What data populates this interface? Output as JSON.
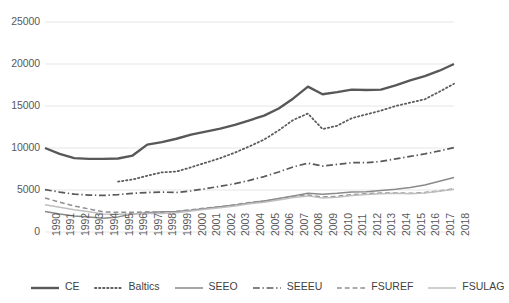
{
  "chart_data": {
    "type": "line",
    "title": "",
    "subtitle": "",
    "xlabel": "",
    "ylabel": "",
    "grid": true,
    "legend_position": "bottom",
    "ylim": [
      0,
      25000
    ],
    "yticks": [
      "0",
      "5000",
      "10000",
      "15000",
      "20000",
      "25000"
    ],
    "ytick_values": [
      0,
      5000,
      10000,
      15000,
      20000,
      25000
    ],
    "x": [
      "1990",
      "1991",
      "1992",
      "1993",
      "1994",
      "1995",
      "1996",
      "1997",
      "1998",
      "1999",
      "2000",
      "2001",
      "2002",
      "2003",
      "2004",
      "2005",
      "2006",
      "2007",
      "2008",
      "2009",
      "2010",
      "2011",
      "2012",
      "2013",
      "2014",
      "2015",
      "2016",
      "2017",
      "2018"
    ],
    "series": [
      {
        "name": "CE",
        "style": "solid",
        "width": 2.4,
        "color": "#58585a",
        "values": [
          10000,
          9300,
          8800,
          8700,
          8700,
          8750,
          9100,
          10400,
          10700,
          11100,
          11600,
          11950,
          12300,
          12750,
          13300,
          13850,
          14700,
          15900,
          17300,
          16400,
          16650,
          16950,
          16900,
          16950,
          17450,
          18050,
          18550,
          19200,
          20000
        ]
      },
      {
        "name": "Baltics",
        "style": "dotted",
        "width": 1.8,
        "color": "#5c5c5e",
        "values": [
          null,
          null,
          null,
          null,
          null,
          6000,
          6250,
          6700,
          7100,
          7200,
          7700,
          8250,
          8800,
          9450,
          10200,
          11000,
          12100,
          13350,
          14100,
          12250,
          12650,
          13550,
          14000,
          14450,
          15000,
          15400,
          15800,
          16700,
          17650
        ]
      },
      {
        "name": "SEEO",
        "style": "solid",
        "width": 1.5,
        "color": "#8a8a8c",
        "values": [
          2450,
          2150,
          1900,
          1800,
          1650,
          1800,
          2150,
          2300,
          2400,
          2450,
          2600,
          2800,
          3000,
          3200,
          3450,
          3700,
          4000,
          4300,
          4600,
          4500,
          4600,
          4750,
          4800,
          4950,
          5100,
          5300,
          5600,
          6050,
          6500
        ]
      },
      {
        "name": "SEEEU",
        "style": "dashdot",
        "width": 1.7,
        "color": "#59595b",
        "values": [
          5050,
          4750,
          4500,
          4400,
          4350,
          4450,
          4600,
          4700,
          4750,
          4700,
          4900,
          5150,
          5450,
          5750,
          6150,
          6600,
          7150,
          7750,
          8200,
          7850,
          8050,
          8250,
          8250,
          8400,
          8700,
          9000,
          9300,
          9650,
          10050
        ]
      },
      {
        "name": "FSUREF",
        "style": "dashed",
        "width": 1.5,
        "color": "#8f8f91",
        "values": [
          4050,
          3550,
          3100,
          2750,
          2400,
          2350,
          2350,
          2400,
          2350,
          2450,
          2650,
          2850,
          3000,
          3250,
          3500,
          3700,
          3950,
          4250,
          4400,
          4150,
          4250,
          4450,
          4550,
          4650,
          4650,
          4600,
          4700,
          4900,
          5150
        ]
      },
      {
        "name": "FSULAG",
        "style": "solid",
        "width": 1.5,
        "color": "#bfbfc1",
        "values": [
          3250,
          2950,
          2650,
          2400,
          2150,
          2100,
          2150,
          2200,
          2200,
          2300,
          2500,
          2700,
          2900,
          3100,
          3350,
          3550,
          3800,
          4100,
          4300,
          4050,
          4150,
          4350,
          4450,
          4550,
          4600,
          4550,
          4650,
          4850,
          5100
        ]
      }
    ]
  },
  "legend": {
    "items": [
      {
        "label": "CE",
        "swatch": "solid-thick",
        "color": "#58585a"
      },
      {
        "label": "Baltics",
        "swatch": "dotted",
        "color": "#5c5c5e"
      },
      {
        "label": "SEEO",
        "swatch": "solid-medium",
        "color": "#8a8a8c"
      },
      {
        "label": "SEEEU",
        "swatch": "dashdot",
        "color": "#59595b"
      },
      {
        "label": "FSUREF",
        "swatch": "dashed",
        "color": "#8f8f91"
      },
      {
        "label": "FSULAG",
        "swatch": "solid-light",
        "color": "#bfbfc1"
      }
    ]
  },
  "axis": {
    "gridline_color": "#e6e6e6",
    "tick_label_color": "#59595b"
  }
}
